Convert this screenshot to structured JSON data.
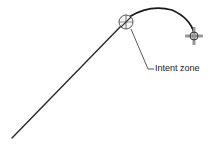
{
  "diagram": {
    "annotation_label": "Intent zone",
    "colors": {
      "stroke": "#2a2a2a",
      "background": "#ffffff",
      "zone_fill": "#f4f4f4"
    },
    "elements": {
      "line": {
        "from": [
          12,
          138
        ],
        "to": [
          120,
          27
        ]
      },
      "intent_zone": {
        "center": [
          126,
          22
        ],
        "radius": 7
      },
      "arc": {
        "from": [
          129,
          17
        ],
        "apex": [
          152,
          9
        ],
        "to": [
          194,
          33
        ]
      },
      "cursor": {
        "center": [
          194,
          36
        ],
        "radius": 4,
        "arm": 9
      },
      "leader": {
        "points": [
          [
            131,
            29
          ],
          [
            148,
            69
          ],
          [
            154,
            69
          ]
        ]
      }
    }
  }
}
